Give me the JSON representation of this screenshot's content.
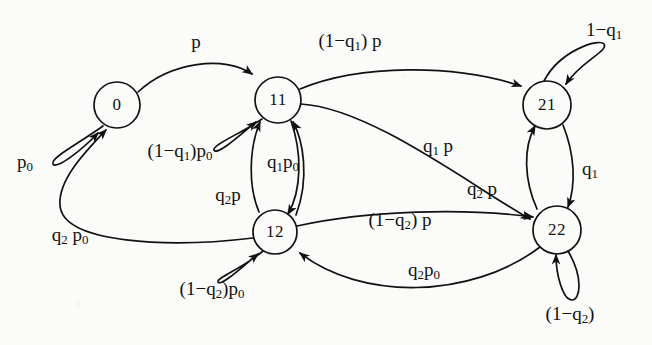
{
  "diagram": {
    "type": "state-transition-diagram",
    "stroke_color": "#111111",
    "background_color": "#fbfbf9",
    "nodes": [
      {
        "id": "0",
        "label": "0",
        "x": 117,
        "y": 105,
        "r": 23
      },
      {
        "id": "11",
        "label": "11",
        "x": 278,
        "y": 100,
        "r": 23
      },
      {
        "id": "21",
        "label": "21",
        "x": 547,
        "y": 105,
        "r": 24
      },
      {
        "id": "12",
        "label": "12",
        "x": 275,
        "y": 232,
        "r": 22
      },
      {
        "id": "22",
        "label": "22",
        "x": 557,
        "y": 230,
        "r": 24
      }
    ],
    "edges": [
      {
        "from": "0",
        "to": "11",
        "label_html": "p",
        "label_text": "p",
        "lx": 196,
        "ly": 42,
        "self": false
      },
      {
        "from": "0",
        "to": "0",
        "label_html": "p<sub>0</sub>",
        "label_text": "p0",
        "lx": 25,
        "ly": 163,
        "self": true
      },
      {
        "from": "11",
        "to": "11",
        "label_html": "(1&#8722;q<sub>1</sub>)p<sub>0</sub>",
        "label_text": "(1-q1)p0",
        "lx": 180,
        "ly": 152,
        "self": true
      },
      {
        "from": "11",
        "to": "21",
        "label_html": "(1&#8722;q<sub>1</sub>) p",
        "label_text": "(1-q1) p",
        "lx": 350,
        "ly": 42,
        "self": false
      },
      {
        "from": "11",
        "to": "22",
        "label_html": "q<sub>1</sub> p",
        "label_text": "q1 p",
        "lx": 438,
        "ly": 147,
        "self": false
      },
      {
        "from": "11",
        "to": "12",
        "label_html": "q<sub>1</sub>p<sub>0</sub>",
        "label_text": "q1p0",
        "lx": 283,
        "ly": 163,
        "self": false
      },
      {
        "from": "12",
        "to": "11",
        "label_html": "q<sub>2</sub>p",
        "label_text": "q2p",
        "lx": 228,
        "ly": 196,
        "self": false
      },
      {
        "from": "12",
        "to": "0",
        "label_html": "q<sub>2</sub> p<sub>0</sub>",
        "label_text": "q2 p0",
        "lx": 70,
        "ly": 236,
        "self": false
      },
      {
        "from": "12",
        "to": "12",
        "label_html": "(1&#8722;q<sub>2</sub>)p<sub>0</sub>",
        "label_text": "(1-q2)p0",
        "lx": 212,
        "ly": 290,
        "self": true
      },
      {
        "from": "12",
        "to": "22",
        "label_html": "(1&#8722;q<sub>2</sub>) p",
        "label_text": "(1-q2) p",
        "lx": 400,
        "ly": 221,
        "self": false
      },
      {
        "from": "21",
        "to": "21",
        "label_html": "1&#8722;q<sub>1</sub>",
        "label_text": "1-q1",
        "lx": 604,
        "ly": 31,
        "self": true
      },
      {
        "from": "21",
        "to": "22",
        "label_html": "q<sub>1</sub>",
        "label_text": "q1",
        "lx": 590,
        "ly": 170,
        "self": false
      },
      {
        "from": "22",
        "to": "21",
        "label_html": "q<sub>2</sub> p",
        "label_text": "q2 p",
        "lx": 482,
        "ly": 190,
        "self": false
      },
      {
        "from": "22",
        "to": "12",
        "label_html": "q<sub>2</sub>p<sub>0</sub>",
        "label_text": "q2p0",
        "lx": 424,
        "ly": 271,
        "self": false
      },
      {
        "from": "22",
        "to": "22",
        "label_html": "(1&#8722;q<sub>2</sub>)",
        "label_text": "(1-q2)",
        "lx": 570,
        "ly": 315,
        "self": true
      }
    ]
  }
}
